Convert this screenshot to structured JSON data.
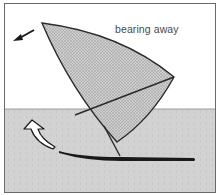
{
  "figure": {
    "caption": "bearing away",
    "colors": {
      "sky": "#ffffff",
      "water": "#d2d2d2",
      "sail_fill": "#c4c4c4",
      "outline": "#2a2a2a",
      "board": "#1a1a1a",
      "frame": "#6a6a6a"
    },
    "elements": [
      {
        "name": "sail",
        "description": "triangular stippled sail"
      },
      {
        "name": "boom",
        "description": "wishbone boom line"
      },
      {
        "name": "mast",
        "description": "mast meeting board"
      },
      {
        "name": "board",
        "description": "dark sailboard hull on water"
      },
      {
        "name": "direction-arrow",
        "description": "small black arrow pointing down-left"
      },
      {
        "name": "turn-arrow",
        "description": "white curved arrow indicating turning away"
      }
    ]
  }
}
